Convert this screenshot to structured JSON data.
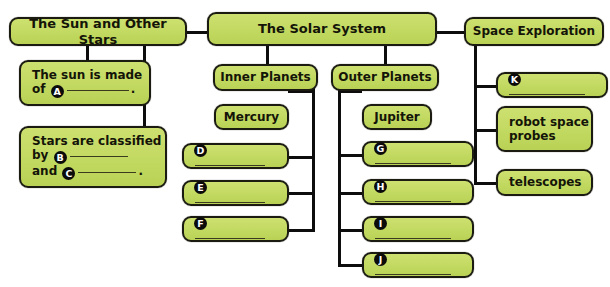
{
  "diagram": {
    "title_hidden_top_artifact": "",
    "theme": {
      "box_fill": "#c2d961",
      "box_fill_light": "#cde070",
      "box_border": "#1b1b12",
      "line_color": "#0d0d0d",
      "text_color": "#141408",
      "marker_fill": "#0b0b0b",
      "marker_text": "#ffffff",
      "background": "#ffffff"
    },
    "nodes": {
      "sun_and_other_stars": "The Sun and Other Stars",
      "sun_is_made_of_line1": "The sun is made",
      "sun_is_made_of_line2_pre": "of",
      "sun_is_made_of_marker": "A",
      "sun_is_made_of_line2_post": ".",
      "stars_classified_line1": "Stars are classified",
      "stars_classified_line2_pre": "by",
      "stars_classified_marker_b": "B",
      "stars_classified_line3_pre": "and",
      "stars_classified_marker_c": "C",
      "stars_classified_line3_post": ".",
      "solar_system": "The Solar System",
      "inner_planets": "Inner Planets",
      "mercury": "Mercury",
      "inner_blank_d": "D",
      "inner_blank_e": "E",
      "inner_blank_f": "F",
      "outer_planets": "Outer Planets",
      "jupiter": "Jupiter",
      "outer_blank_g": "G",
      "outer_blank_h": "H",
      "outer_blank_i": "I",
      "outer_blank_j": "J",
      "space_exploration": "Space Exploration",
      "space_blank_k": "K",
      "robot_space_probes_line1": "robot space",
      "robot_space_probes_line2": "probes",
      "telescopes": "telescopes"
    }
  }
}
